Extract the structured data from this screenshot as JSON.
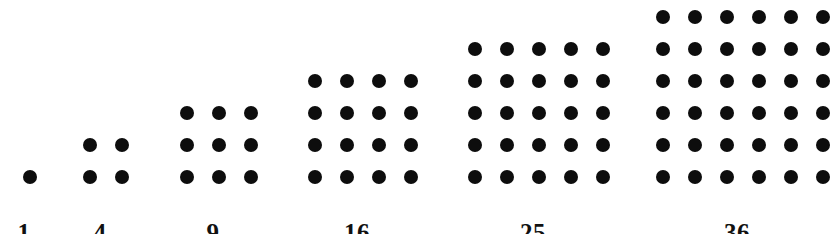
{
  "figure": {
    "background_color": "#ffffff",
    "dot_color": "#0d0d0d",
    "label_color": "#111111",
    "dot_diameter_px": 14,
    "dot_pitch_px": 32,
    "baseline_y_px": 170,
    "label_baseline_y_px": 220
  },
  "chart_data": {
    "type": "bar",
    "xlabel": "",
    "ylabel": "",
    "categories": [
      "1",
      "4",
      "9",
      "16",
      "25",
      "36"
    ],
    "values": [
      1,
      4,
      9,
      16,
      25,
      36
    ],
    "series": [
      {
        "name": "dots per square",
        "values": [
          1,
          4,
          9,
          16,
          25,
          36
        ]
      },
      {
        "name": "side length (rows = columns)",
        "values": [
          1,
          2,
          3,
          4,
          5,
          6
        ]
      }
    ],
    "grid": false,
    "legend": "none",
    "annotations": [
      "1",
      "4",
      "9",
      "16",
      "25",
      "36"
    ]
  },
  "groups": [
    {
      "label": "1",
      "side": 1,
      "count": 1,
      "left_px": 14,
      "width_px": 20,
      "label_center_px": 24
    },
    {
      "label": "4",
      "side": 2,
      "count": 4,
      "left_px": 74,
      "width_px": 52,
      "label_center_px": 100
    },
    {
      "label": "9",
      "side": 3,
      "count": 9,
      "left_px": 171,
      "width_px": 84,
      "label_center_px": 213
    },
    {
      "label": "16",
      "side": 4,
      "count": 16,
      "left_px": 299,
      "width_px": 116,
      "label_center_px": 357
    },
    {
      "label": "25",
      "side": 5,
      "count": 25,
      "left_px": 459,
      "width_px": 148,
      "label_center_px": 533
    },
    {
      "label": "36",
      "side": 6,
      "count": 36,
      "left_px": 647,
      "width_px": 180,
      "label_center_px": 737
    }
  ]
}
